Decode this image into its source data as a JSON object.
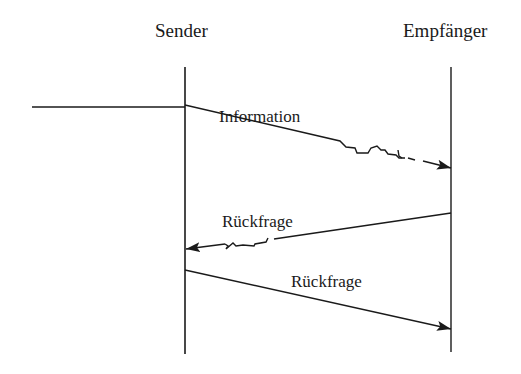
{
  "diagram": {
    "type": "sequence",
    "colors": {
      "line": "#1a1a1a",
      "background": "#ffffff"
    },
    "participants": [
      {
        "id": "sender",
        "label": "Sender"
      },
      {
        "id": "empfaenger",
        "label": "Empfänger"
      }
    ],
    "messages": [
      {
        "from": "sender",
        "to": "empfaenger",
        "label": "Information",
        "style": "disturbed"
      },
      {
        "from": "empfaenger",
        "to": "sender",
        "label": "Rückfrage",
        "style": "disturbed"
      },
      {
        "from": "sender",
        "to": "empfaenger",
        "label": "Rückfrage",
        "style": "solid"
      }
    ]
  }
}
